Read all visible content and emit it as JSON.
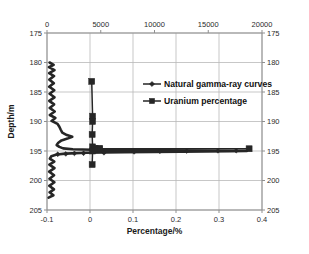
{
  "chart_data": {
    "type": "line",
    "title": "",
    "xlabel": "Percentage/%",
    "ylabel": "Depth/m",
    "secondary_xlabel": "",
    "orientation": "depth-vertical-inverted",
    "grid": true,
    "legend_position": "inside-upper-right",
    "axes": {
      "bottom": {
        "label": "Percentage/%",
        "min": -0.1,
        "max": 0.4,
        "step": 0.1,
        "ticks": [
          "-0.1",
          "0",
          "0.1",
          "0.2",
          "0.3",
          "0.4"
        ],
        "applies_to": "Uranium percentage"
      },
      "top": {
        "label": "",
        "min": 0,
        "max": 20000,
        "step": 5000,
        "ticks": [
          "0",
          "5000",
          "10000",
          "15000",
          "20000"
        ],
        "applies_to": "Natural gamma-ray curves"
      },
      "left": {
        "label": "Depth/m",
        "min": 175,
        "max": 205,
        "step": 5,
        "inverted": true,
        "ticks": [
          "175",
          "180",
          "185",
          "190",
          "195",
          "200",
          "205"
        ]
      },
      "right": {
        "label": "",
        "min": 175,
        "max": 205,
        "step": 5,
        "inverted": true,
        "ticks": [
          "175",
          "180",
          "185",
          "190",
          "195",
          "200",
          "205"
        ]
      }
    },
    "series": [
      {
        "name": "Natural gamma-ray curves",
        "marker": "diamond",
        "color": "#262626",
        "axis": "top",
        "units": "counts",
        "points": [
          {
            "depth": 180.0,
            "value": 240
          },
          {
            "depth": 180.4,
            "value": 620
          },
          {
            "depth": 180.8,
            "value": 180
          },
          {
            "depth": 181.3,
            "value": 700
          },
          {
            "depth": 181.8,
            "value": 200
          },
          {
            "depth": 182.3,
            "value": 660
          },
          {
            "depth": 182.9,
            "value": 220
          },
          {
            "depth": 183.5,
            "value": 640
          },
          {
            "depth": 184.1,
            "value": 200
          },
          {
            "depth": 184.7,
            "value": 680
          },
          {
            "depth": 185.3,
            "value": 240
          },
          {
            "depth": 185.9,
            "value": 700
          },
          {
            "depth": 186.5,
            "value": 210
          },
          {
            "depth": 187.1,
            "value": 660
          },
          {
            "depth": 187.7,
            "value": 250
          },
          {
            "depth": 188.3,
            "value": 720
          },
          {
            "depth": 188.9,
            "value": 260
          },
          {
            "depth": 189.4,
            "value": 780
          },
          {
            "depth": 189.9,
            "value": 420
          },
          {
            "depth": 190.4,
            "value": 980
          },
          {
            "depth": 190.9,
            "value": 1150
          },
          {
            "depth": 191.4,
            "value": 1280
          },
          {
            "depth": 191.9,
            "value": 1420
          },
          {
            "depth": 192.3,
            "value": 1850
          },
          {
            "depth": 192.6,
            "value": 2350
          },
          {
            "depth": 192.9,
            "value": 1900
          },
          {
            "depth": 193.2,
            "value": 1350
          },
          {
            "depth": 193.6,
            "value": 1050
          },
          {
            "depth": 194.0,
            "value": 900
          },
          {
            "depth": 194.3,
            "value": 1150
          },
          {
            "depth": 194.55,
            "value": 1500
          },
          {
            "depth": 194.7,
            "value": 2400
          },
          {
            "depth": 194.8,
            "value": 4200
          },
          {
            "depth": 194.85,
            "value": 7000
          },
          {
            "depth": 194.9,
            "value": 11000
          },
          {
            "depth": 194.92,
            "value": 14500
          },
          {
            "depth": 194.95,
            "value": 17200
          },
          {
            "depth": 194.97,
            "value": 18400
          },
          {
            "depth": 195.0,
            "value": 18600
          },
          {
            "depth": 195.05,
            "value": 17000
          },
          {
            "depth": 195.1,
            "value": 12500
          },
          {
            "depth": 195.2,
            "value": 7200
          },
          {
            "depth": 195.3,
            "value": 3600
          },
          {
            "depth": 195.45,
            "value": 1700
          },
          {
            "depth": 195.6,
            "value": 900
          },
          {
            "depth": 195.9,
            "value": 400
          },
          {
            "depth": 196.3,
            "value": 260
          },
          {
            "depth": 196.8,
            "value": 680
          },
          {
            "depth": 197.3,
            "value": 220
          },
          {
            "depth": 197.9,
            "value": 700
          },
          {
            "depth": 198.5,
            "value": 200
          },
          {
            "depth": 199.1,
            "value": 660
          },
          {
            "depth": 199.7,
            "value": 230
          },
          {
            "depth": 200.3,
            "value": 690
          },
          {
            "depth": 200.9,
            "value": 210
          },
          {
            "depth": 201.5,
            "value": 650
          },
          {
            "depth": 202.0,
            "value": 240
          },
          {
            "depth": 202.5,
            "value": 600
          },
          {
            "depth": 202.9,
            "value": 150
          }
        ],
        "marker_points": [
          {
            "depth": 195.55,
            "value": 1000
          },
          {
            "depth": 195.5,
            "value": 1750
          },
          {
            "depth": 195.4,
            "value": 2550
          },
          {
            "depth": 195.38,
            "value": 3400
          },
          {
            "depth": 195.3,
            "value": 5300
          },
          {
            "depth": 195.15,
            "value": 8100
          },
          {
            "depth": 195.05,
            "value": 10500
          },
          {
            "depth": 195.0,
            "value": 13000
          },
          {
            "depth": 194.97,
            "value": 15900
          },
          {
            "depth": 194.95,
            "value": 17600
          }
        ]
      },
      {
        "name": "Uranium percentage",
        "marker": "square",
        "color": "#262626",
        "axis": "bottom",
        "units": "%",
        "points": [
          {
            "depth": 183.2,
            "value": 0.004
          },
          {
            "depth": 189.1,
            "value": 0.006
          },
          {
            "depth": 190.0,
            "value": 0.006
          },
          {
            "depth": 192.2,
            "value": 0.005
          },
          {
            "depth": 194.3,
            "value": 0.006
          },
          {
            "depth": 194.55,
            "value": 0.012
          },
          {
            "depth": 194.6,
            "value": 0.022
          },
          {
            "depth": 194.62,
            "value": 0.37
          },
          {
            "depth": 194.62,
            "value": 0.022
          },
          {
            "depth": 194.7,
            "value": 0.01
          },
          {
            "depth": 195.0,
            "value": 0.006
          },
          {
            "depth": 197.3,
            "value": 0.005
          }
        ],
        "spike": {
          "depth": 194.62,
          "value": 0.37
        }
      }
    ],
    "legend": [
      {
        "label": "Natural gamma-ray curves",
        "marker": "diamond"
      },
      {
        "label": "Uranium percentage",
        "marker": "square"
      }
    ]
  }
}
